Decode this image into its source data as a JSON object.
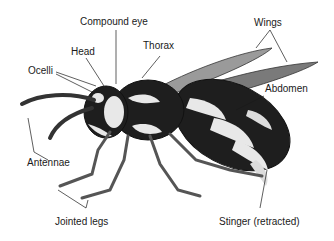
{
  "figure": {
    "labels": {
      "compound_eye": "Compound eye",
      "head": "Head",
      "ocelli": "Ocelli",
      "thorax": "Thorax",
      "wings": "Wings",
      "abdomen": "Abdomen",
      "antennae": "Antennae",
      "jointed_legs": "Jointed legs",
      "stinger": "Stinger (retracted)"
    },
    "colors": {
      "ink": "#1a1a1a",
      "body_dark": "#1e1e1e",
      "body_light": "#e8e8e8",
      "wing": "#8a8a8a",
      "leg": "#cfcfcf"
    }
  }
}
